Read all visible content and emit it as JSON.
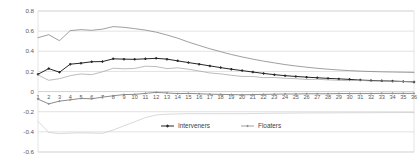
{
  "chart_data": {
    "type": "line",
    "title": "",
    "subtitle": "",
    "xlabel": "",
    "ylabel": "",
    "xlim": [
      1,
      36
    ],
    "ylim": [
      -0.6,
      0.8
    ],
    "grid": true,
    "legend_position": "bottom-center",
    "y_ticks": [
      "0.8",
      "0.6",
      "0.4",
      "0.2",
      "0",
      "-0.2",
      "-0.4",
      "-0.6"
    ],
    "y_tick_values": [
      0.8,
      0.6,
      0.4,
      0.2,
      0,
      -0.2,
      -0.4,
      -0.6
    ],
    "x": [
      1,
      2,
      3,
      4,
      5,
      6,
      7,
      8,
      9,
      10,
      11,
      12,
      13,
      14,
      15,
      16,
      17,
      18,
      19,
      20,
      21,
      22,
      23,
      24,
      25,
      26,
      27,
      28,
      29,
      30,
      31,
      32,
      33,
      34,
      35,
      36
    ],
    "x_tick_labels": [
      "1",
      "2",
      "3",
      "4",
      "5",
      "6",
      "7",
      "8",
      "9",
      "10",
      "11",
      "12",
      "13",
      "14",
      "15",
      "16",
      "17",
      "18",
      "19",
      "20",
      "21",
      "22",
      "23",
      "24",
      "25",
      "26",
      "27",
      "28",
      "29",
      "30",
      "31",
      "32",
      "33",
      "34",
      "35",
      "36"
    ],
    "series": [
      {
        "name": "Interveners upper bound",
        "in_legend": false,
        "marker": "none",
        "color": "#7f7f7f",
        "values": [
          0.535,
          0.565,
          0.505,
          0.605,
          0.615,
          0.608,
          0.62,
          0.645,
          0.638,
          0.625,
          0.61,
          0.59,
          0.562,
          0.53,
          0.492,
          0.458,
          0.425,
          0.396,
          0.368,
          0.344,
          0.322,
          0.302,
          0.285,
          0.268,
          0.254,
          0.242,
          0.231,
          0.222,
          0.214,
          0.208,
          0.203,
          0.199,
          0.196,
          0.194,
          0.192,
          0.19
        ]
      },
      {
        "name": "Interveners",
        "in_legend": true,
        "marker": "cross",
        "color": "#262626",
        "values": [
          0.172,
          0.228,
          0.192,
          0.272,
          0.282,
          0.296,
          0.298,
          0.325,
          0.322,
          0.32,
          0.325,
          0.33,
          0.322,
          0.305,
          0.288,
          0.272,
          0.255,
          0.238,
          0.222,
          0.208,
          0.194,
          0.18,
          0.168,
          0.158,
          0.15,
          0.143,
          0.137,
          0.131,
          0.126,
          0.121,
          0.114,
          0.11,
          0.107,
          0.104,
          0.1,
          0.096
        ]
      },
      {
        "name": "Interveners lower bound",
        "in_legend": false,
        "marker": "none",
        "color": "#a6a6a6",
        "values": [
          0.165,
          0.112,
          0.128,
          0.158,
          0.175,
          0.168,
          0.196,
          0.232,
          0.226,
          0.23,
          0.252,
          0.248,
          0.228,
          0.236,
          0.222,
          0.204,
          0.185,
          0.176,
          0.162,
          0.15,
          0.15,
          0.138,
          0.14,
          0.132,
          0.128,
          0.12,
          0.122,
          0.116,
          0.112,
          0.108,
          0.112,
          0.105,
          0.106,
          0.102,
          0.1,
          0.098
        ]
      },
      {
        "name": "Floaters",
        "in_legend": true,
        "marker": "cross",
        "color": "#8c8c8c",
        "values": [
          -0.075,
          -0.122,
          -0.095,
          -0.082,
          -0.068,
          -0.072,
          -0.055,
          -0.042,
          -0.03,
          -0.028,
          -0.018,
          -0.008,
          -0.014,
          -0.02,
          -0.018,
          -0.022,
          -0.026,
          -0.028,
          -0.03,
          -0.032,
          -0.03,
          -0.028,
          -0.026,
          -0.024,
          -0.024,
          -0.022,
          -0.022,
          -0.022,
          -0.02,
          -0.02,
          -0.02,
          -0.02,
          -0.018,
          -0.018,
          -0.018,
          -0.018
        ]
      },
      {
        "name": "Floaters lower bound",
        "in_legend": false,
        "marker": "none",
        "color": "#cccccc",
        "values": [
          -0.295,
          -0.405,
          -0.418,
          -0.412,
          -0.41,
          -0.412,
          -0.415,
          -0.382,
          -0.34,
          -0.3,
          -0.258,
          -0.232,
          -0.225,
          -0.222,
          -0.22,
          -0.22,
          -0.22,
          -0.22,
          -0.22,
          -0.22,
          -0.218,
          -0.216,
          -0.215,
          -0.214,
          -0.213,
          -0.212,
          -0.212,
          -0.212,
          -0.211,
          -0.21,
          -0.21,
          -0.21,
          -0.209,
          -0.208,
          -0.208,
          -0.208
        ]
      }
    ],
    "legend": [
      {
        "label": "Interveners",
        "color": "#262626",
        "marker": "cross"
      },
      {
        "label": "Floaters",
        "color": "#8c8c8c",
        "marker": "cross"
      }
    ]
  }
}
